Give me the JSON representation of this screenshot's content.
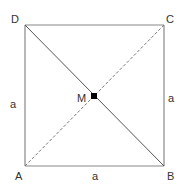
{
  "diagram": {
    "type": "geometry",
    "shape": "square",
    "vertices": {
      "A": {
        "label": "A",
        "x": 25,
        "y": 166
      },
      "B": {
        "label": "B",
        "x": 164,
        "y": 166
      },
      "C": {
        "label": "C",
        "x": 164,
        "y": 25
      },
      "D": {
        "label": "D",
        "x": 25,
        "y": 25
      }
    },
    "center": {
      "label": "M",
      "x": 94,
      "y": 96
    },
    "side_labels": {
      "left": "a",
      "right": "a",
      "bottom": "a"
    },
    "diagonals": [
      {
        "from": "D",
        "to": "B",
        "style": "solid"
      },
      {
        "from": "A",
        "to": "C",
        "style": "dashed"
      }
    ],
    "colors": {
      "stroke": "#777777",
      "diagonal": "#555555",
      "text": "#333333",
      "point": "#000000"
    }
  }
}
